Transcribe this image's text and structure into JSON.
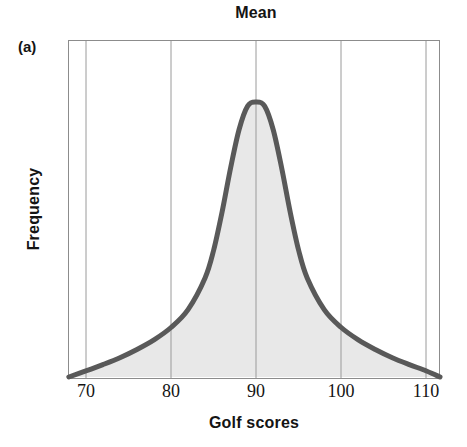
{
  "figure": {
    "panel_label": "(a)",
    "title": "Mean",
    "xlabel": "Golf scores",
    "ylabel": "Frequency"
  },
  "colors": {
    "curve": "#595959",
    "fill": "#e8e8e8",
    "gridline": "#9a9a9a",
    "axis": "#8c8c8c",
    "text": "#141414",
    "background": "#ffffff"
  },
  "chart_data": {
    "type": "line",
    "title": "Mean",
    "xlabel": "Golf scores",
    "ylabel": "Frequency",
    "xlim": [
      67.9,
      111.6
    ],
    "ylim": [
      0,
      1
    ],
    "xticks": [
      70,
      80,
      90,
      100,
      110
    ],
    "xtick_labels": [
      "70",
      "80",
      "90",
      "100",
      "110"
    ],
    "yticks": [],
    "ytick_labels": [],
    "grid": "vertical-only",
    "legend": "none",
    "annotations": [
      {
        "text": "Mean",
        "x": 90,
        "note": "title placed directly above the peak, marking the mean of the distribution"
      },
      {
        "text": "(a)",
        "note": "panel identifier at upper left"
      }
    ],
    "series": [
      {
        "name": "Golf score frequency distribution",
        "shape": "symmetric bell-shaped curve with heavy tails, peak at the mean",
        "mean": 90,
        "peak_x": 90,
        "filled": true,
        "x": [
          68,
          70,
          72,
          74,
          76,
          78,
          80,
          82,
          84,
          85,
          86,
          87,
          88,
          89,
          90,
          91,
          92,
          93,
          94,
          95,
          96,
          98,
          100,
          102,
          104,
          106,
          108,
          110,
          111.6
        ],
        "y": [
          0.0,
          0.022,
          0.045,
          0.07,
          0.1,
          0.135,
          0.18,
          0.245,
          0.36,
          0.46,
          0.6,
          0.76,
          0.9,
          0.985,
          1.0,
          0.985,
          0.9,
          0.76,
          0.6,
          0.46,
          0.36,
          0.245,
          0.18,
          0.135,
          0.1,
          0.07,
          0.045,
          0.022,
          0.0
        ]
      }
    ]
  },
  "xtick_positions_px": [
    86,
    171,
    256,
    341,
    426
  ],
  "plot_area_px": {
    "left": 68,
    "right": 440,
    "top": 40,
    "bottom": 378
  }
}
